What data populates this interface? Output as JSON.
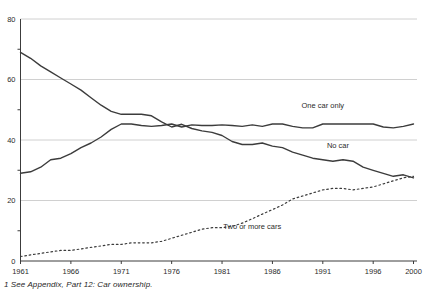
{
  "chart_data": {
    "type": "line",
    "title": "",
    "xlabel": "",
    "ylabel": "",
    "x_range": [
      1961,
      2000
    ],
    "y_range": [
      0,
      80
    ],
    "x_tick_labels": [
      "1961",
      "1966",
      "1971",
      "1976",
      "1981",
      "1986",
      "1991",
      "1996",
      "2000"
    ],
    "x_tick_years": [
      1961,
      1966,
      1971,
      1976,
      1981,
      1986,
      1991,
      1996,
      2000
    ],
    "y_tick_labels": [
      "0",
      "20",
      "40",
      "60",
      "80"
    ],
    "y_ticks_labeled": [
      0,
      20,
      40,
      60,
      80
    ],
    "y_ticks_minor": [
      10,
      30,
      50,
      70
    ],
    "grid": "horizontal gridlines at 20, 40, 60, 80; legend as inline labels",
    "series": [
      {
        "name": "No car",
        "style": "solid",
        "label": "No car",
        "label_at": {
          "year": 1992.5,
          "value": 37.2
        },
        "values": [
          69,
          67,
          64.5,
          62.5,
          60.5,
          58.5,
          56.5,
          54,
          51.5,
          49.5,
          48.5,
          48.5,
          48.5,
          48,
          46,
          44.3,
          45.2,
          43.8,
          43,
          42.5,
          41.5,
          39.5,
          38.5,
          38.5,
          39,
          38,
          37.5,
          36,
          35,
          34,
          33.5,
          33,
          33.5,
          33,
          31,
          30,
          29,
          28,
          28.5,
          27.5
        ]
      },
      {
        "name": "One car only",
        "style": "solid",
        "label": "One car only",
        "label_at": {
          "year": 1991,
          "value": 50.5
        },
        "values": [
          29,
          29.5,
          31,
          33.5,
          34,
          35.5,
          37.5,
          39,
          41,
          43.5,
          45.3,
          45.3,
          44.8,
          44.5,
          44.8,
          45.3,
          44.3,
          45,
          44.8,
          44.8,
          45,
          44.8,
          44.5,
          45,
          44.5,
          45.3,
          45.3,
          44.5,
          44,
          44,
          45.3,
          45.3,
          45.3,
          45.3,
          45.3,
          45.3,
          44.3,
          44,
          44.5,
          45.3
        ]
      },
      {
        "name": "Two or more cars",
        "style": "dotted",
        "label": "Two or more cars",
        "label_at": {
          "year": 1984,
          "value": 10.6
        },
        "values": [
          1.5,
          2,
          2.5,
          3,
          3.5,
          3.5,
          4,
          4.5,
          5,
          5.5,
          5.5,
          6,
          6,
          6,
          6.5,
          7.5,
          8.5,
          9.5,
          10.5,
          11,
          11,
          11.5,
          12.5,
          14,
          15.5,
          17,
          18.5,
          20.5,
          21.5,
          22.5,
          23.5,
          24,
          24,
          23.5,
          24,
          24.5,
          25.5,
          26.5,
          27.5,
          28
        ]
      }
    ]
  },
  "footnote": "1 See Appendix, Part 12: Car ownership.",
  "colors": {
    "line": "#3c3c3c",
    "grid": "#cbcbcb",
    "axis": "#3c3c3c",
    "text": "#2b2b2b",
    "background": "#ffffff"
  }
}
